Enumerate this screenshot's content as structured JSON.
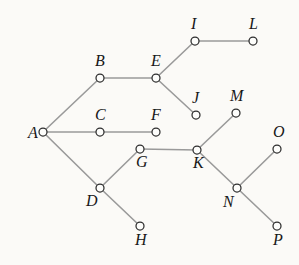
{
  "figure": {
    "kind": "undirected-graph-diagram",
    "background_color": "#fbfaf7",
    "width": 299,
    "height": 265,
    "edge_color": "#9a9a9a",
    "node_fill_color": "#fdfdfb",
    "node_stroke_color": "#2e2e2e",
    "label_color": "#171717"
  },
  "graph_data": {
    "type": "graph",
    "node_count": 16,
    "edge_count": 15,
    "nodes": [
      {
        "id": "A",
        "label": "A",
        "x": 43,
        "y": 132,
        "r": 4.0,
        "label_dx": -15,
        "label_dy": -7,
        "label_pos": "left"
      },
      {
        "id": "B",
        "label": "B",
        "x": 100,
        "y": 78,
        "r": 4.0,
        "label_dx": -5,
        "label_dy": -25,
        "label_pos": "above-left"
      },
      {
        "id": "C",
        "label": "C",
        "x": 100,
        "y": 132,
        "r": 4.0,
        "label_dx": -5,
        "label_dy": -25,
        "label_pos": "above-left"
      },
      {
        "id": "D",
        "label": "D",
        "x": 100,
        "y": 188,
        "r": 4.0,
        "label_dx": -14,
        "label_dy": 5,
        "label_pos": "below-left"
      },
      {
        "id": "E",
        "label": "E",
        "x": 156,
        "y": 78,
        "r": 4.0,
        "label_dx": -5,
        "label_dy": -25,
        "label_pos": "above-left"
      },
      {
        "id": "F",
        "label": "F",
        "x": 156,
        "y": 132,
        "r": 4.0,
        "label_dx": -5,
        "label_dy": -25,
        "label_pos": "above-left"
      },
      {
        "id": "G",
        "label": "G",
        "x": 140,
        "y": 149,
        "r": 4.0,
        "label_dx": -4,
        "label_dy": 5,
        "label_pos": "below-left"
      },
      {
        "id": "H",
        "label": "H",
        "x": 140,
        "y": 226,
        "r": 4.0,
        "label_dx": -5,
        "label_dy": 6,
        "label_pos": "below"
      },
      {
        "id": "I",
        "label": "I",
        "x": 195,
        "y": 41,
        "r": 4.0,
        "label_dx": -4,
        "label_dy": -25,
        "label_pos": "above"
      },
      {
        "id": "J",
        "label": "J",
        "x": 196,
        "y": 115,
        "r": 4.0,
        "label_dx": -4,
        "label_dy": -25,
        "label_pos": "above"
      },
      {
        "id": "K",
        "label": "K",
        "x": 197,
        "y": 150,
        "r": 4.0,
        "label_dx": -4,
        "label_dy": 5,
        "label_pos": "below-left"
      },
      {
        "id": "L",
        "label": "L",
        "x": 253,
        "y": 41,
        "r": 4.0,
        "label_dx": -4,
        "label_dy": -25,
        "label_pos": "above"
      },
      {
        "id": "M",
        "label": "M",
        "x": 236,
        "y": 113,
        "r": 4.0,
        "label_dx": -6,
        "label_dy": -25,
        "label_pos": "above"
      },
      {
        "id": "N",
        "label": "N",
        "x": 237,
        "y": 188,
        "r": 4.0,
        "label_dx": -14,
        "label_dy": 6,
        "label_pos": "below-left"
      },
      {
        "id": "O",
        "label": "O",
        "x": 277,
        "y": 149,
        "r": 4.0,
        "label_dx": -4,
        "label_dy": -25,
        "label_pos": "above"
      },
      {
        "id": "P",
        "label": "P",
        "x": 277,
        "y": 226,
        "r": 4.0,
        "label_dx": -4,
        "label_dy": 6,
        "label_pos": "below"
      }
    ],
    "edges": [
      {
        "source": "A",
        "target": "B"
      },
      {
        "source": "A",
        "target": "C"
      },
      {
        "source": "A",
        "target": "D"
      },
      {
        "source": "B",
        "target": "E"
      },
      {
        "source": "C",
        "target": "F"
      },
      {
        "source": "E",
        "target": "I"
      },
      {
        "source": "E",
        "target": "J"
      },
      {
        "source": "I",
        "target": "L"
      },
      {
        "source": "D",
        "target": "G"
      },
      {
        "source": "D",
        "target": "H"
      },
      {
        "source": "G",
        "target": "K"
      },
      {
        "source": "K",
        "target": "M"
      },
      {
        "source": "K",
        "target": "N"
      },
      {
        "source": "N",
        "target": "O"
      },
      {
        "source": "N",
        "target": "P"
      }
    ]
  }
}
